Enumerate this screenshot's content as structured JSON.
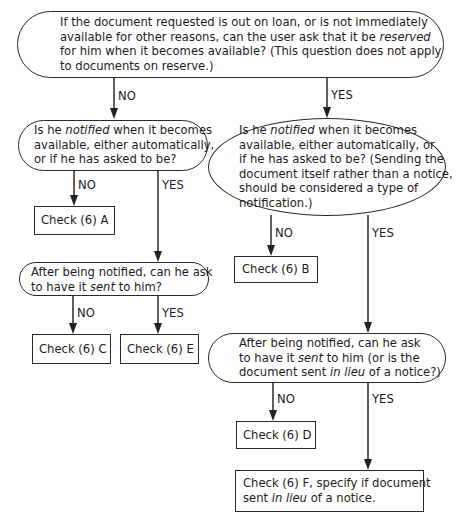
{
  "flowchart": {
    "q1": {
      "lines": [
        {
          "pre": "If the document requested is out on loan, or is not immediately",
          "it": "",
          "post": ""
        },
        {
          "pre": "available for other reasons, can the user ask that it be ",
          "it": "reserved",
          "post": ""
        },
        {
          "pre": "for him when it becomes available? (This question does not apply",
          "it": "",
          "post": ""
        },
        {
          "pre": "to documents on reserve.)",
          "it": "",
          "post": ""
        }
      ]
    },
    "q1_no_label": "NO",
    "q1_yes_label": "YES",
    "q2_left": {
      "lines": [
        {
          "pre": "Is he ",
          "it": "notified",
          "post": " when it becomes"
        },
        {
          "pre": "available, either automatically,",
          "it": "",
          "post": ""
        },
        {
          "pre": "or if he has asked to be?",
          "it": "",
          "post": ""
        }
      ]
    },
    "q2_left_no_label": "NO",
    "q2_left_yes_label": "YES",
    "check_a": "Check (6) A",
    "q3_left": {
      "lines": [
        {
          "pre": "After being notified, can he ask",
          "it": "",
          "post": ""
        },
        {
          "pre": "to have it ",
          "it": "sent",
          "post": " to him?"
        }
      ]
    },
    "q3_left_no_label": "NO",
    "q3_left_yes_label": "YES",
    "check_c": "Check (6) C",
    "check_e": "Check (6) E",
    "q2_right": {
      "lines": [
        {
          "pre": "Is he ",
          "it": "notified",
          "post": " when it becomes"
        },
        {
          "pre": "available, either automatically, or",
          "it": "",
          "post": ""
        },
        {
          "pre": "if he has asked to be? (Sending the",
          "it": "",
          "post": ""
        },
        {
          "pre": "document itself rather than a notice,",
          "it": "",
          "post": ""
        },
        {
          "pre": "should be considered a type of",
          "it": "",
          "post": ""
        },
        {
          "pre": "notification.)",
          "it": "",
          "post": ""
        }
      ]
    },
    "q2_right_no_label": "NO",
    "q2_right_yes_label": "YES",
    "check_b": "Check (6) B",
    "q3_right": {
      "lines": [
        {
          "pre": "After being notified, can he ask",
          "it": "",
          "post": ""
        },
        {
          "pre": "to have it ",
          "it": "sent",
          "post": " to him (or is the"
        },
        {
          "pre": "document sent ",
          "it": "in lieu",
          "post": " of a notice?)"
        }
      ]
    },
    "q3_right_no_label": "NO",
    "q3_right_yes_label": "YES",
    "check_d": "Check (6) D",
    "check_f": {
      "lines": [
        {
          "pre": "Check (6) F, specify if document",
          "it": "",
          "post": ""
        },
        {
          "pre": "sent ",
          "it": "in lieu",
          "post": " of a notice."
        }
      ]
    }
  }
}
